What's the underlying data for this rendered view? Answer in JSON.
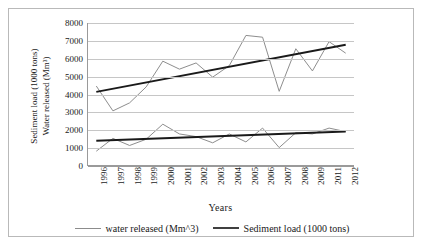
{
  "chart_data": {
    "type": "line",
    "title": "",
    "xlabel": "Years",
    "ylabel_lines": [
      "Sediment load (1000 tons)",
      "Water released (Mm³)"
    ],
    "categories": [
      "1996",
      "1997",
      "1998",
      "1999",
      "2000",
      "2001",
      "2002",
      "2003",
      "2004",
      "2005",
      "2006",
      "2007",
      "2008",
      "2009",
      "2011",
      "2012"
    ],
    "ylim": [
      0,
      8000
    ],
    "yticks": [
      8000,
      7000,
      6000,
      5000,
      4000,
      3000,
      2000,
      1000,
      0
    ],
    "grid": true,
    "legend_position": "bottom",
    "series": [
      {
        "name": "water released (Mm^3)",
        "color": "#8c8c8c",
        "width": 1,
        "values": [
          4450,
          3050,
          3500,
          4400,
          5850,
          5400,
          5750,
          4950,
          5600,
          7300,
          7200,
          4150,
          6550,
          5300,
          6950,
          6300
        ]
      },
      {
        "name": "Sediment load (1000 tons)",
        "color": "#8c8c8c",
        "width": 1,
        "values": [
          780,
          1500,
          1100,
          1450,
          2300,
          1750,
          1600,
          1250,
          1750,
          1300,
          2080,
          980,
          1820,
          1750,
          2080,
          1880
        ]
      }
    ],
    "trendlines": [
      {
        "name": "water-released-trendline",
        "color": "#1a1a1a",
        "width": 2,
        "start_value": 4120,
        "end_value": 6780
      },
      {
        "name": "sediment-load-trendline",
        "color": "#1a1a1a",
        "width": 2,
        "start_value": 1360,
        "end_value": 1890
      }
    ]
  },
  "legend": {
    "items": [
      {
        "label": "water released (Mm^3)",
        "color": "#8c8c8c",
        "width": 1
      },
      {
        "label": "Sediment load (1000 tons)",
        "color": "#404040",
        "width": 2
      }
    ]
  }
}
